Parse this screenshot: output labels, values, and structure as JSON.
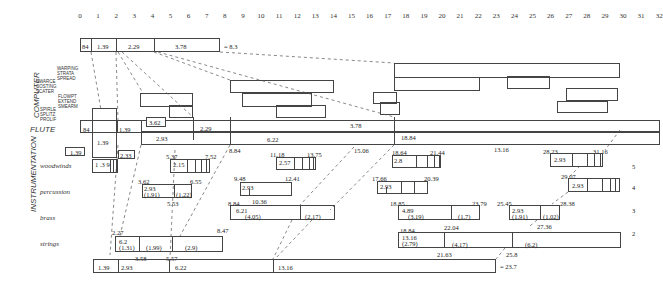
{
  "axis": {
    "ticks": [
      "0",
      "1",
      "2",
      "3",
      "4",
      "5",
      "6",
      "7",
      "8",
      "9",
      "10",
      "11",
      "12",
      "13",
      "14",
      "15",
      "16",
      "17",
      "18",
      "19",
      "20",
      "21",
      "22",
      "23",
      "24",
      "25",
      "26",
      "27",
      "28",
      "29",
      "30",
      "31",
      "32"
    ]
  },
  "top_bar": {
    "segments": [
      "84",
      "1.39",
      "2.29",
      "3.78"
    ],
    "total": "= 8.3"
  },
  "bottom_bar": {
    "segments": [
      "1.39",
      "2.93",
      "6.22",
      "13.16"
    ],
    "total": "= 23.7"
  },
  "section_labels": {
    "computer": "COMPUTER",
    "flute": "FLUTE",
    "instrumentation": "INSTRUMENTATION"
  },
  "computer_processes": {
    "group1": "WARPING\nSTRATA\nSPREAD",
    "group2": "SWARCE\nCOSTING\nSCATER",
    "group3": "FLOWPT\nEXTEND\nSMEARM",
    "group4": "SPIRLE\nSPLITZ\nPROLIF"
  },
  "flute": {
    "row1": [
      "84",
      "1.39",
      "3.62",
      "2.29",
      "3.78",
      "18.84"
    ],
    "row2": [
      "1.39",
      "2.93",
      "6.22",
      "13.16"
    ],
    "markers": [
      "8.84",
      "15.06"
    ]
  },
  "instruments": [
    {
      "name": "woodwinds",
      "level": "5"
    },
    {
      "name": "percussion",
      "level": "4"
    },
    {
      "name": "brass",
      "level": "3"
    },
    {
      "name": "strings",
      "level": "2"
    }
  ],
  "woodwinds": {
    "small_boxes": [
      "1.39",
      "2.33",
      "1 .3 9"
    ],
    "b1": {
      "start": "5.37",
      "end": "7.52",
      "value": "2.15"
    },
    "b2": {
      "start": "11.18",
      "end": "13.75",
      "value": "2.57"
    },
    "b3": {
      "start": "18.64",
      "end": "21.44",
      "value": "2.8"
    },
    "b4": {
      "start": "28.23",
      "end": "31.16",
      "value": "2.93"
    }
  },
  "percussion": {
    "b1": {
      "start": "3.62",
      "end": "6.55",
      "value": "2.93",
      "sub1": "(1.91)",
      "sub2": "(1.22)",
      "mark": "5.53"
    },
    "b2": {
      "start": "9.48",
      "end": "12.41",
      "value": "2.93",
      "mark": "10.36"
    },
    "b3": {
      "start": "17.66",
      "end": "20.39",
      "value": "2.93"
    },
    "b4": {
      "start": "29.07",
      "end": "28.38",
      "value": "2.93"
    }
  },
  "brass": {
    "b1": {
      "start": "8.84",
      "value": "6.21",
      "sub1": "(4.05)",
      "sub2": "(2.17)"
    },
    "b2": {
      "start": "18.85",
      "end": "23.79",
      "value": "4.89",
      "sub1": "(3.19)",
      "sub2": "(1.7)"
    },
    "b3": {
      "start": "25.45",
      "value": "2.93",
      "sub1": "(1.91)",
      "sub2": "(1.02)",
      "mark": "27.36"
    }
  },
  "strings": {
    "b1": {
      "start": "2.27",
      "end": "8.47",
      "value": "6.2",
      "sub1": "(1.31)",
      "sub2": "(1.99)",
      "sub3": "(2.9)",
      "m1": "3.58",
      "m2": "5.57"
    },
    "b2": {
      "start": "18.84",
      "value": "13.16",
      "sub1": "(2.79)",
      "sub2": "(4.17)",
      "sub3": "(6.2)",
      "m1": "22.04",
      "m2": "21.63",
      "m3": "25.8"
    }
  }
}
